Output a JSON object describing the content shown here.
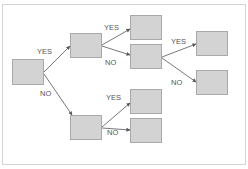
{
  "diagram": {
    "type": "decision-tree",
    "nodes": [
      {
        "id": "root",
        "x": 12,
        "y": 59,
        "w": 32,
        "h": 26
      },
      {
        "id": "n1",
        "x": 70,
        "y": 33,
        "w": 32,
        "h": 25
      },
      {
        "id": "n2",
        "x": 70,
        "y": 115,
        "w": 32,
        "h": 25
      },
      {
        "id": "n1a",
        "x": 130,
        "y": 15,
        "w": 32,
        "h": 25
      },
      {
        "id": "n1b",
        "x": 130,
        "y": 44,
        "w": 32,
        "h": 25
      },
      {
        "id": "n1b1",
        "x": 196,
        "y": 31,
        "w": 32,
        "h": 25
      },
      {
        "id": "n1b2",
        "x": 196,
        "y": 70,
        "w": 32,
        "h": 25
      },
      {
        "id": "n2a",
        "x": 130,
        "y": 89,
        "w": 32,
        "h": 25
      },
      {
        "id": "n2b",
        "x": 130,
        "y": 118,
        "w": 32,
        "h": 25
      }
    ],
    "edges": [
      {
        "from": "root",
        "to": "n1",
        "label": "YES"
      },
      {
        "from": "root",
        "to": "n2",
        "label": "NO"
      },
      {
        "from": "n1",
        "to": "n1a",
        "label": "YES"
      },
      {
        "from": "n1",
        "to": "n1b",
        "label": "NO"
      },
      {
        "from": "n1b",
        "to": "n1b1",
        "label": "YES"
      },
      {
        "from": "n1b",
        "to": "n1b2",
        "label": "NO"
      },
      {
        "from": "n2",
        "to": "n2a",
        "label": "YES"
      },
      {
        "from": "n2",
        "to": "n2b",
        "label": "NO"
      }
    ],
    "labels": {
      "root_yes": "YES",
      "root_no": "NO",
      "n1_yes": "YES",
      "n1_no": "NO",
      "n1b_yes": "YES",
      "n1b_no": "NO",
      "n2_yes": "YES",
      "n2_no": "NO"
    },
    "colors": {
      "node_fill": "#d3d3d3",
      "node_border": "#a9a9a9",
      "edge": "#555555",
      "label": "#555555",
      "frame": "#d4d4d4"
    }
  }
}
